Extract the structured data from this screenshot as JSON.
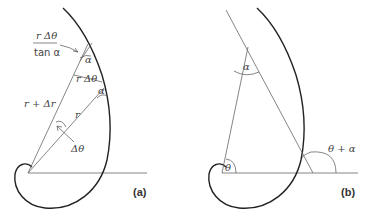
{
  "figure": {
    "panel_a": {
      "label": "(a)",
      "annotations": {
        "arc_numerator": "r Δθ",
        "arc_denominator": "tan α",
        "chord_label": "r Δθ",
        "alpha_upper": "α",
        "alpha_lower": "α",
        "radius_outer": "r + Δr",
        "radius_inner": "r",
        "delta_theta": "Δθ"
      }
    },
    "panel_b": {
      "label": "(b)",
      "annotations": {
        "alpha_apex": "α",
        "theta": "θ",
        "theta_plus_alpha": "θ + α"
      }
    }
  }
}
